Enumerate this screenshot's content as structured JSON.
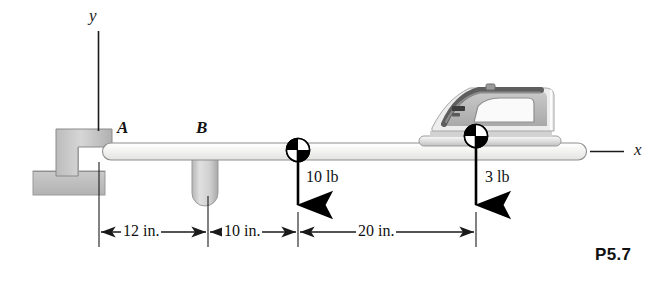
{
  "figure": {
    "label": "P5.7",
    "axes": {
      "y_label": "y",
      "x_label": "x"
    },
    "points": [
      {
        "name": "A",
        "label": "A"
      },
      {
        "name": "B",
        "label": "B"
      }
    ],
    "loads": [
      {
        "name": "load-10lb",
        "label": "10 lb",
        "magnitude": 10,
        "unit": "lb",
        "direction": "down",
        "station_in": 22
      },
      {
        "name": "load-3lb",
        "label": "3 lb",
        "magnitude": 3,
        "unit": "lb",
        "direction": "down",
        "station_in": 42
      }
    ],
    "dimensions": [
      {
        "name": "dim-12in",
        "label": "12 in.",
        "value": 12,
        "unit": "in."
      },
      {
        "name": "dim-10in",
        "label": "10 in.",
        "value": 10,
        "unit": "in."
      },
      {
        "name": "dim-20in",
        "label": "20 in.",
        "value": 20,
        "unit": "in."
      }
    ],
    "objects": [
      {
        "name": "clothes-iron",
        "description": "clothes iron resting on beam"
      },
      {
        "name": "wall-bracket",
        "description": "L-shaped wall bracket support at A"
      },
      {
        "name": "post-support",
        "description": "rounded post support at B"
      },
      {
        "name": "beam",
        "description": "horizontal beam with rounded ends"
      }
    ],
    "colors": {
      "beam_fill": "#f2f2f0",
      "bracket_fill": "#c8c8c8",
      "base_fill": "#bdbdbd",
      "iron_body": "#b8b8b8",
      "iron_shell": "#ededed",
      "line": "#1a1a1a"
    }
  }
}
